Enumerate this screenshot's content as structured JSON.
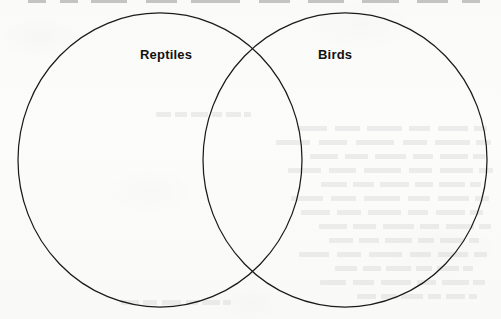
{
  "figure": {
    "type": "venn-diagram",
    "set_count": 2,
    "background_color": "#fbfbfa",
    "stroke_color": "#1b1b1b",
    "label_color": "#111111",
    "sets": [
      {
        "id": "reptiles",
        "label": "Reptiles",
        "position": "left",
        "center_x": 160,
        "center_y": 160,
        "radius_x": 142,
        "radius_y": 147,
        "label_x": 140,
        "label_y": 47
      },
      {
        "id": "birds",
        "label": "Birds",
        "position": "right",
        "center_x": 345,
        "center_y": 160,
        "radius_x": 142,
        "radius_y": 147,
        "label_x": 318,
        "label_y": 47
      }
    ],
    "intersection": {
      "label": "",
      "upper_crossing_x": 253,
      "upper_crossing_y": 40,
      "lower_crossing_x": 253,
      "lower_crossing_y": 277
    }
  },
  "page": {
    "width": 501,
    "height": 319,
    "has_paper_texture": true,
    "has_reverse_side_bleed_through": true,
    "bleed_through_legible": false
  }
}
